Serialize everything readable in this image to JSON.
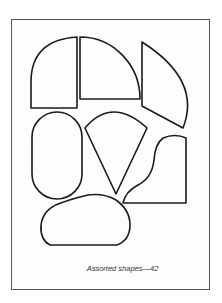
{
  "figure": {
    "caption": "Assorted shapes—42",
    "stroke_color": "#1a1a1a",
    "frame_color": "#555555",
    "shapes": [
      {
        "name": "quarter-rounded-rect",
        "label": "Shape 1"
      },
      {
        "name": "quarter-circle",
        "label": "Shape 2"
      },
      {
        "name": "circular-sector",
        "label": "Shape 3"
      },
      {
        "name": "stadium",
        "label": "Shape 4"
      },
      {
        "name": "cone-sector",
        "label": "Shape 5"
      },
      {
        "name": "wavy-quadrilateral",
        "label": "Shape 6"
      },
      {
        "name": "rounded-blob",
        "label": "Shape 7"
      }
    ]
  }
}
